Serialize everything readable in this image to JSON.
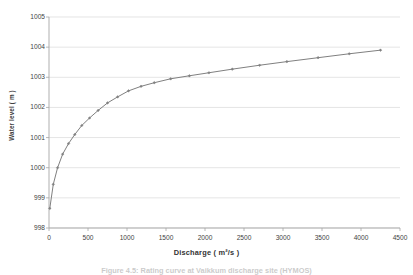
{
  "figure": {
    "caption": "Figure 4.5: Rating curve at Vaikkum discharge site (HYMOS)",
    "background_color": "#ffffff"
  },
  "axes": {
    "y_title": "Water level ( m )",
    "x_title": "Discharge ( m²/s )",
    "y_ticks": [
      "998",
      "999",
      "1000",
      "1001",
      "1002",
      "1003",
      "1004",
      "1005"
    ],
    "x_ticks": [
      "0",
      "500",
      "1000",
      "1500",
      "2000",
      "2500",
      "3000",
      "3500",
      "4000",
      "4500"
    ],
    "gridline_color": "#d9d9d9",
    "axis_line_color": "#a6a6a6"
  },
  "chart_data": {
    "type": "line",
    "title": "",
    "subtitle": "",
    "xlabel": "Discharge ( m²/s )",
    "ylabel": "Water level ( m )",
    "xlim": [
      0,
      4500
    ],
    "ylim": [
      998,
      1005
    ],
    "grid": "horizontal",
    "legend": "none",
    "series_color": "#808080",
    "marker": "diamond",
    "series": [
      {
        "name": "Rating curve",
        "x": [
          10,
          55,
          110,
          175,
          250,
          330,
          420,
          520,
          630,
          750,
          880,
          1020,
          1180,
          1350,
          1560,
          1800,
          2050,
          2350,
          2700,
          3050,
          3450,
          3850,
          4250
        ],
        "y": [
          998.65,
          999.45,
          1000.0,
          1000.45,
          1000.8,
          1001.1,
          1001.4,
          1001.65,
          1001.9,
          1002.15,
          1002.35,
          1002.55,
          1002.7,
          1002.82,
          1002.95,
          1003.05,
          1003.15,
          1003.27,
          1003.4,
          1003.52,
          1003.65,
          1003.78,
          1003.9
        ]
      }
    ]
  }
}
